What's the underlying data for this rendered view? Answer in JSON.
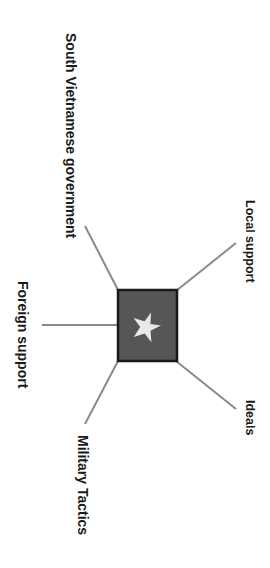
{
  "diagram": {
    "type": "spider-map",
    "orientation": "rotated-90-clockwise",
    "center": {
      "icon": "flag-star-icon",
      "description": "Dark gray rectangle with white five-pointed star",
      "fill_color": "#565656",
      "border_color": "#1a1a1a",
      "star_color": "#e8e8e8"
    },
    "branches": [
      {
        "id": "south-vietnamese-government",
        "label": "South Vietnamese government"
      },
      {
        "id": "local-support",
        "label": "Local support"
      },
      {
        "id": "foreign-support",
        "label": "Foreign support"
      },
      {
        "id": "ideals",
        "label": "Ideals"
      },
      {
        "id": "military-tactics",
        "label": "Military Tactics"
      }
    ],
    "line_color": "#8a8a8a",
    "text_color": "#1a1a1a",
    "background": "#ffffff"
  }
}
